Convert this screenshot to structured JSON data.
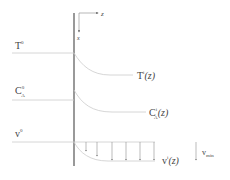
{
  "diagram": {
    "axes": {
      "z_label": "z",
      "x_label": "x"
    },
    "profiles": [
      {
        "id": "temperature",
        "bulk_label": "T",
        "bulk_sup": "0",
        "interface_label": "T",
        "interface_sup": "i",
        "arg": "(z)"
      },
      {
        "id": "concentration",
        "bulk_label": "C",
        "bulk_sup": "0",
        "bulk_sub": "A",
        "interface_label": "C",
        "interface_sup": "i",
        "interface_sub": "A",
        "arg": "(z)"
      },
      {
        "id": "velocity",
        "bulk_label": "v",
        "bulk_sup": "0",
        "interface_label": "v",
        "interface_sup": "i",
        "arg": "(z)"
      }
    ],
    "vmin": {
      "label": "v",
      "sub": "min"
    },
    "colors": {
      "line": "#cccccc",
      "wall": "#555555",
      "text": "#444444"
    }
  }
}
